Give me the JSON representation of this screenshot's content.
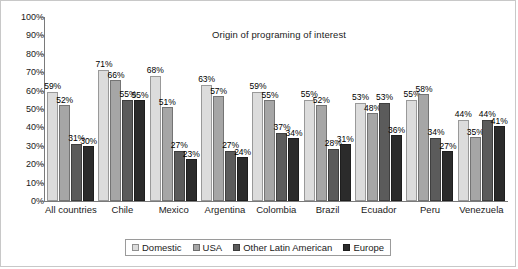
{
  "chart_data": {
    "type": "bar",
    "title": "Origin of programing of interest",
    "xlabel": "",
    "ylabel": "",
    "ylim": [
      0,
      100
    ],
    "ytick_labels": [
      "100%",
      "90%",
      "80%",
      "70%",
      "60%",
      "50%",
      "40%",
      "30%",
      "20%",
      "10%",
      "0%"
    ],
    "ytick_values": [
      100,
      90,
      80,
      70,
      60,
      50,
      40,
      30,
      20,
      10,
      0
    ],
    "grid": false,
    "legend_position": "bottom",
    "value_suffix": "%",
    "categories": [
      "All countries",
      "Chile",
      "Mexico",
      "Argentina",
      "Colombia",
      "Brazil",
      "Ecuador",
      "Peru",
      "Venezuela"
    ],
    "series": [
      {
        "name": "Domestic",
        "color": "#dcdcdc",
        "values": [
          59,
          71,
          68,
          63,
          59,
          55,
          53,
          55,
          44
        ]
      },
      {
        "name": "USA",
        "color": "#a6a6a6",
        "values": [
          52,
          66,
          51,
          57,
          55,
          52,
          48,
          58,
          35
        ]
      },
      {
        "name": "Other Latin American",
        "color": "#5b5b5b",
        "values": [
          31,
          55,
          27,
          27,
          37,
          28,
          53,
          34,
          44
        ]
      },
      {
        "name": "Europe",
        "color": "#2b2b2b",
        "values": [
          30,
          55,
          23,
          24,
          34,
          31,
          36,
          27,
          41
        ]
      }
    ]
  }
}
